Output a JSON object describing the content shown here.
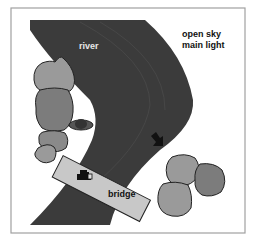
{
  "diagram": {
    "labels": {
      "river": "river",
      "sky_line1": "open sky",
      "sky_line2": "main light",
      "bridge": "bridge"
    },
    "colors": {
      "river": "#3a3a3a",
      "tree_light": "#9a9a9a",
      "tree_dark": "#7c7c7c",
      "bridge": "#c8c8c8",
      "frame": "#9a9a9a",
      "background": "#ffffff"
    },
    "icons": [
      "camera-icon",
      "arrow-icon",
      "subject-icon"
    ]
  }
}
